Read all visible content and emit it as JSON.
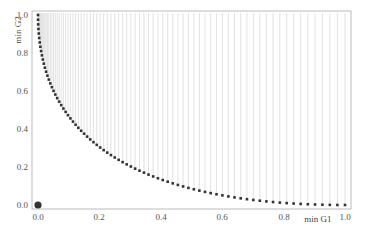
{
  "chart_data": {
    "type": "scatter",
    "title": "",
    "xlabel": "min G1",
    "ylabel": "min G2",
    "xlim": [
      0.0,
      1.0
    ],
    "ylim": [
      0.0,
      1.0
    ],
    "x_ticks": [
      "0.0",
      "0.2",
      "0.4",
      "0.6",
      "0.8",
      "1.0"
    ],
    "y_ticks": [
      "0.0",
      "0.2",
      "0.4",
      "0.6",
      "0.8",
      "1.0"
    ],
    "grid": false,
    "legend": null,
    "curve_description": "Pareto front points following y = (1 - sqrt(x))^2, with vertical light-gray lines from each point up to y = 1.0",
    "front_points_count": 81,
    "front_parametrization": "x = t^2, y = (1 - t)^2, t from 0 to 1",
    "sample_points": [
      {
        "x": 0.0,
        "y": 1.0
      },
      {
        "x": 0.01,
        "y": 0.81
      },
      {
        "x": 0.04,
        "y": 0.64
      },
      {
        "x": 0.09,
        "y": 0.49
      },
      {
        "x": 0.16,
        "y": 0.36
      },
      {
        "x": 0.25,
        "y": 0.25
      },
      {
        "x": 0.36,
        "y": 0.16
      },
      {
        "x": 0.49,
        "y": 0.09
      },
      {
        "x": 0.64,
        "y": 0.04
      },
      {
        "x": 0.81,
        "y": 0.01
      },
      {
        "x": 1.0,
        "y": 0.0
      }
    ],
    "highlight_point": {
      "x": 0.0,
      "y": 0.0,
      "label": ""
    },
    "colors": {
      "points": "#333333",
      "lines": "#d6d6d6",
      "frame": "#aaaaaa",
      "highlight": "#333333"
    }
  }
}
